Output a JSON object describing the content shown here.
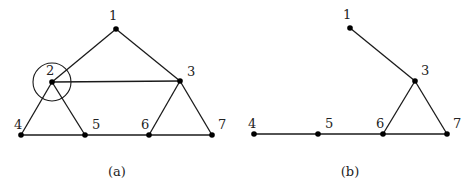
{
  "figures": [
    {
      "id": "a",
      "caption": "(a)",
      "caption_pos": [
        117,
        176
      ],
      "nodes": [
        {
          "id": "1",
          "label": "1",
          "x": 116,
          "y": 29,
          "lx": 109,
          "ly": 20
        },
        {
          "id": "2",
          "label": "2",
          "x": 52,
          "y": 82,
          "lx": 46,
          "ly": 75
        },
        {
          "id": "3",
          "label": "3",
          "x": 180,
          "y": 81,
          "lx": 187,
          "ly": 76
        },
        {
          "id": "4",
          "label": "4",
          "x": 21,
          "y": 135,
          "lx": 14,
          "ly": 129
        },
        {
          "id": "5",
          "label": "5",
          "x": 85,
          "y": 135,
          "lx": 92,
          "ly": 129
        },
        {
          "id": "6",
          "label": "6",
          "x": 149,
          "y": 135,
          "lx": 141,
          "ly": 129
        },
        {
          "id": "7",
          "label": "7",
          "x": 212,
          "y": 135,
          "lx": 218,
          "ly": 129
        }
      ],
      "edges": [
        [
          "1",
          "2"
        ],
        [
          "1",
          "3"
        ],
        [
          "2",
          "3"
        ],
        [
          "2",
          "4"
        ],
        [
          "2",
          "5"
        ],
        [
          "3",
          "6"
        ],
        [
          "3",
          "7"
        ],
        [
          "4",
          "5"
        ],
        [
          "5",
          "6"
        ],
        [
          "6",
          "7"
        ]
      ],
      "highlight": {
        "node": "2",
        "shape": "circle",
        "r": 19
      }
    },
    {
      "id": "b",
      "caption": "(b)",
      "caption_pos": [
        350,
        176
      ],
      "nodes": [
        {
          "id": "1",
          "label": "1",
          "x": 350,
          "y": 28,
          "lx": 343,
          "ly": 19
        },
        {
          "id": "3",
          "label": "3",
          "x": 415,
          "y": 81,
          "lx": 421,
          "ly": 75
        },
        {
          "id": "4",
          "label": "4",
          "x": 254,
          "y": 134,
          "lx": 248,
          "ly": 128
        },
        {
          "id": "5",
          "label": "5",
          "x": 318,
          "y": 134,
          "lx": 325,
          "ly": 128
        },
        {
          "id": "6",
          "label": "6",
          "x": 383,
          "y": 134,
          "lx": 376,
          "ly": 128
        },
        {
          "id": "7",
          "label": "7",
          "x": 447,
          "y": 134,
          "lx": 453,
          "ly": 128
        }
      ],
      "edges": [
        [
          "1",
          "3"
        ],
        [
          "3",
          "6"
        ],
        [
          "3",
          "7"
        ],
        [
          "4",
          "5"
        ],
        [
          "5",
          "6"
        ],
        [
          "6",
          "7"
        ]
      ]
    }
  ]
}
